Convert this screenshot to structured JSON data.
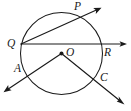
{
  "figure": {
    "kind": "circle-geometry-diagram",
    "width": 131,
    "height": 111,
    "background_color": "#ffffff",
    "stroke_color": "#1a1a1a"
  },
  "circle": {
    "name": "circle-O",
    "center_x": 61.5,
    "center_y": 53.5,
    "radius": 41.0
  },
  "center_point": {
    "label": "O",
    "x": 61.5,
    "y": 53.5,
    "label_x": 66,
    "label_y": 47
  },
  "points": [
    {
      "id": "P",
      "label": "P",
      "x": 80.0,
      "y": 17.0,
      "label_x": 74,
      "label_y": 1
    },
    {
      "id": "Q",
      "label": "Q",
      "x": 21.0,
      "y": 44.0,
      "label_x": 7,
      "label_y": 38
    },
    {
      "id": "R",
      "label": "R",
      "x": 102.0,
      "y": 44.0,
      "label_x": 104,
      "label_y": 47
    },
    {
      "id": "A",
      "label": "A",
      "x": 25.5,
      "y": 73.0,
      "label_x": 14,
      "label_y": 63
    },
    {
      "id": "C",
      "label": "C",
      "x": 97.0,
      "y": 80.0,
      "label_x": 100,
      "label_y": 72
    }
  ],
  "rays": [
    {
      "id": "ray-QR",
      "label": "Q through O to R and beyond",
      "from_x": 21.0,
      "from_y": 44.0,
      "to_x": 127.0,
      "to_y": 44.0,
      "arrow_at_end": true
    },
    {
      "id": "ray-QP",
      "label": "Q through P and beyond",
      "from_x": 21.0,
      "from_y": 44.0,
      "to_x": 101.0,
      "to_y": 8.0,
      "arrow_at_end": true
    },
    {
      "id": "ray-OA",
      "label": "O through A and beyond",
      "from_x": 61.5,
      "from_y": 53.5,
      "to_x": 4.0,
      "to_y": 92.0,
      "arrow_at_end": true
    },
    {
      "id": "ray-OC",
      "label": "O through C and beyond",
      "from_x": 61.5,
      "from_y": 53.5,
      "to_x": 124.0,
      "to_y": 104.0,
      "arrow_at_end": true
    }
  ]
}
